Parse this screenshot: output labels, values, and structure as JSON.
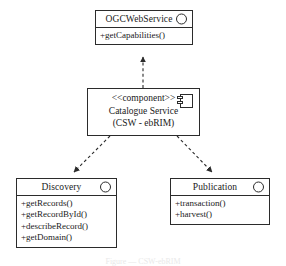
{
  "diagram": {
    "type": "uml-component-diagram",
    "stroke_color": "#2b2b2b",
    "fill_color": "#ffffff",
    "caption": "Figure — CSW-ebRIM",
    "nodes": {
      "ogc_web_service": {
        "name": "OGCWebService",
        "icon": "interface-lollipop-circle",
        "operations": [
          "+getCapabilities()"
        ]
      },
      "catalogue_service": {
        "stereotype": "<<component>>",
        "name": "Catalogue Service",
        "subtitle": "(CSW - ebRIM)",
        "icon": "component-icon"
      },
      "discovery": {
        "name": "Discovery",
        "icon": "interface-lollipop-circle",
        "operations": [
          "+getRecords()",
          "+getRecordById()",
          "+describeRecord()",
          "+getDomain()"
        ]
      },
      "publication": {
        "name": "Publication",
        "icon": "interface-lollipop-circle",
        "operations": [
          "+transaction()",
          "+harvest()"
        ]
      }
    },
    "connectors": [
      {
        "id": "realization-up",
        "from": "catalogue_service",
        "to": "ogc_web_service",
        "style": "dashed",
        "arrowhead": "solid-filled"
      },
      {
        "id": "dependency-discovery",
        "from": "catalogue_service",
        "to": "discovery",
        "style": "dashed",
        "arrowhead": "solid-filled"
      },
      {
        "id": "dependency-publication",
        "from": "catalogue_service",
        "to": "publication",
        "style": "dashed",
        "arrowhead": "solid-filled"
      }
    ]
  }
}
